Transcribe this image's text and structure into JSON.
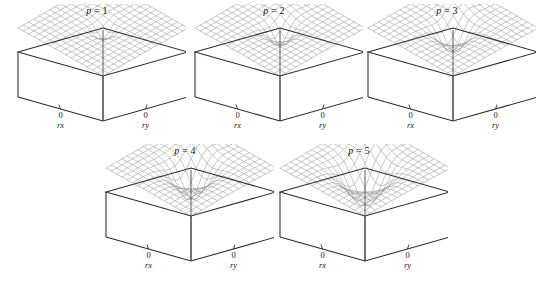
{
  "figure": {
    "width": 542,
    "height": 284,
    "background": "#ffffff",
    "box_edge_color": "#2b2b2b",
    "mesh_color": "#9a9a9a",
    "mesh_highlight_color": "#8a8a8a",
    "tick_zero_label": "0"
  },
  "chart_data": {
    "type": "line",
    "title": "",
    "subtitle": "",
    "xlabel": "rx",
    "ylabel": "ry",
    "zlabel": "",
    "xticks": [
      0
    ],
    "yticks": [
      0
    ],
    "xtick_labels": [
      "0"
    ],
    "ytick_labels": [
      "0"
    ],
    "grid": false,
    "legend": false,
    "legend_position": "none",
    "xlim": [
      -1,
      1
    ],
    "ylim": [
      -1,
      1
    ],
    "zlim": [
      -1,
      1
    ],
    "mesh_n": 17,
    "panels": [
      {
        "id": "p1",
        "param_name": "p",
        "param_value": 1,
        "title": "p = 1",
        "well_depth": 0.3,
        "well_width": 0.13,
        "bump_height": 0.05,
        "bump_width": 0.2,
        "ripple_amp": 0.012
      },
      {
        "id": "p2",
        "param_name": "p",
        "param_value": 2,
        "title": "p = 2",
        "well_depth": 0.46,
        "well_width": 0.16,
        "bump_height": 0.13,
        "bump_width": 0.21,
        "ripple_amp": 0.014
      },
      {
        "id": "p3",
        "param_name": "p",
        "param_value": 3,
        "title": "p = 3",
        "well_depth": 0.62,
        "well_width": 0.19,
        "bump_height": 0.2,
        "bump_width": 0.22,
        "ripple_amp": 0.016
      },
      {
        "id": "p4",
        "param_name": "p",
        "param_value": 4,
        "title": "p = 4",
        "well_depth": 0.8,
        "well_width": 0.23,
        "bump_height": 0.26,
        "bump_width": 0.24,
        "ripple_amp": 0.018
      },
      {
        "id": "p5",
        "param_name": "p",
        "param_value": 5,
        "title": "p = 5",
        "well_depth": 0.95,
        "well_width": 0.27,
        "bump_height": 0.31,
        "bump_width": 0.26,
        "ripple_amp": 0.02
      }
    ]
  },
  "layout": {
    "panel_positions": [
      {
        "id": "p1",
        "left": 8,
        "top": 4
      },
      {
        "id": "p2",
        "left": 185,
        "top": 4
      },
      {
        "id": "p3",
        "left": 358,
        "top": 4
      },
      {
        "id": "p4",
        "left": 96,
        "top": 144
      },
      {
        "id": "p5",
        "left": 270,
        "top": 144
      }
    ]
  }
}
